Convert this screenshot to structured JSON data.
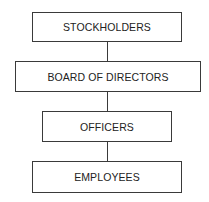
{
  "diagram": {
    "type": "org-chart",
    "nodes": [
      {
        "id": "stockholders",
        "label": "STOCKHOLDERS"
      },
      {
        "id": "board",
        "label": "BOARD OF DIRECTORS"
      },
      {
        "id": "officers",
        "label": "OFFICERS"
      },
      {
        "id": "employees",
        "label": "EMPLOYEES"
      }
    ],
    "edges": [
      {
        "from": "stockholders",
        "to": "board"
      },
      {
        "from": "board",
        "to": "officers"
      },
      {
        "from": "officers",
        "to": "employees"
      }
    ]
  }
}
